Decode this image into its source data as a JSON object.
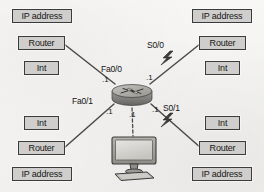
{
  "diagram": {
    "background_color": "#f3f2f0",
    "box_fill": "#cfcecc",
    "box_border": "#3b3b3b",
    "line_color": "#4a4a4a"
  },
  "label_groups": {
    "top_left": {
      "position": "top-left",
      "boxes": [
        {
          "text": "IP address",
          "size": "wide"
        },
        {
          "text": "Router",
          "size": "med"
        },
        {
          "text": "Int",
          "size": "narr"
        }
      ]
    },
    "top_right": {
      "position": "top-right",
      "boxes": [
        {
          "text": "IP address",
          "size": "wide"
        },
        {
          "text": "Router",
          "size": "med"
        },
        {
          "text": "Int",
          "size": "narr"
        }
      ]
    },
    "bottom_left": {
      "position": "bottom-left",
      "boxes": [
        {
          "text": "Int",
          "size": "narr"
        },
        {
          "text": "Router",
          "size": "med"
        },
        {
          "text": "IP address",
          "size": "wide"
        }
      ]
    },
    "bottom_right": {
      "position": "bottom-right",
      "boxes": [
        {
          "text": "Int",
          "size": "narr"
        },
        {
          "text": "Router",
          "size": "med"
        },
        {
          "text": "IP address",
          "size": "wide"
        }
      ]
    }
  },
  "interfaces": [
    {
      "name": "Fa0/0",
      "type": "fastethernet",
      "direction": "upper-left"
    },
    {
      "name": "Fa0/1",
      "type": "fastethernet",
      "direction": "lower-left"
    },
    {
      "name": "S0/0",
      "type": "serial",
      "direction": "upper-right"
    },
    {
      "name": "S0/1",
      "type": "serial",
      "direction": "lower-right"
    }
  ],
  "host_octets": [
    {
      "text": ".1",
      "near": "fa0-0-upper-left"
    },
    {
      "text": ".1",
      "near": "s0-0-upper-right"
    },
    {
      "text": ".1",
      "near": "fa0-1-lower-left"
    },
    {
      "text": ".1",
      "near": "pc-link-lower-center"
    },
    {
      "text": ".1",
      "near": "s0-1-lower-right"
    }
  ],
  "devices": [
    {
      "name": "central-router",
      "kind": "router",
      "icon": "cisco-router-icon"
    },
    {
      "name": "workstation",
      "kind": "pc",
      "icon": "desktop-computer-icon"
    }
  ]
}
